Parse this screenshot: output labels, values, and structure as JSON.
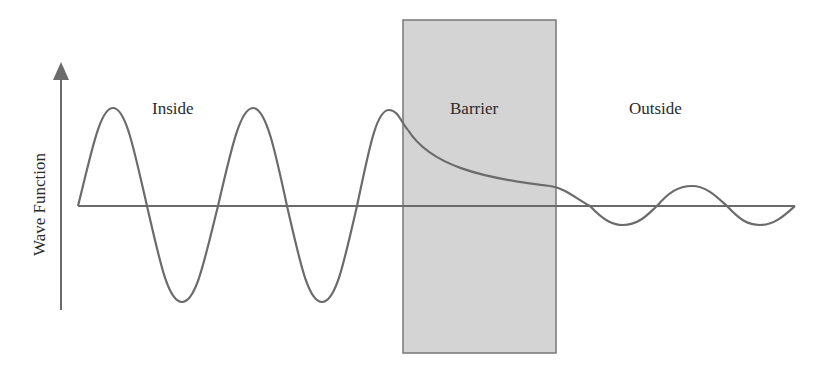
{
  "diagram": {
    "type": "quantum-tunneling-wavefunction",
    "y_axis_label": "Wave Function",
    "regions": [
      {
        "id": "inside",
        "label": "Inside"
      },
      {
        "id": "barrier",
        "label": "Barrier"
      },
      {
        "id": "outside",
        "label": "Outside"
      }
    ],
    "colors": {
      "curve": "#6b6b6b",
      "axis": "#6b6b6b",
      "barrier_fill": "#d4d4d4",
      "barrier_stroke": "#777777",
      "text": "#2a2a2a"
    }
  }
}
